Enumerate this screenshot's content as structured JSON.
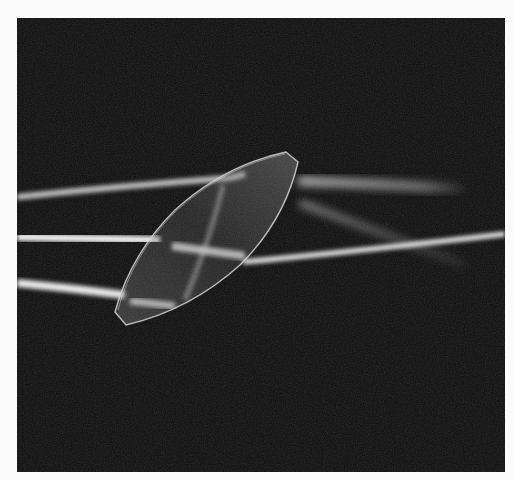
{
  "image": {
    "subject": "Biconvex lens refracting three parallel light beams",
    "background_color": "#0b0b0b",
    "frame_color": "#fbfbfb",
    "beam_color": "#f2f2f2"
  },
  "scene": {
    "beams": [
      {
        "name": "upper-beam",
        "description": "enters from left, passes above lens, diverges faintly to the right"
      },
      {
        "name": "middle-beam",
        "description": "enters from left, refracted through lens center, exits toward right"
      },
      {
        "name": "lower-beam",
        "description": "enters from left, refracted by lower lens edge, converges to focal region"
      }
    ],
    "lens": {
      "shape": "biconvex ellipse with chamfered ends",
      "orientation": "tilted approx 45 degrees"
    }
  }
}
